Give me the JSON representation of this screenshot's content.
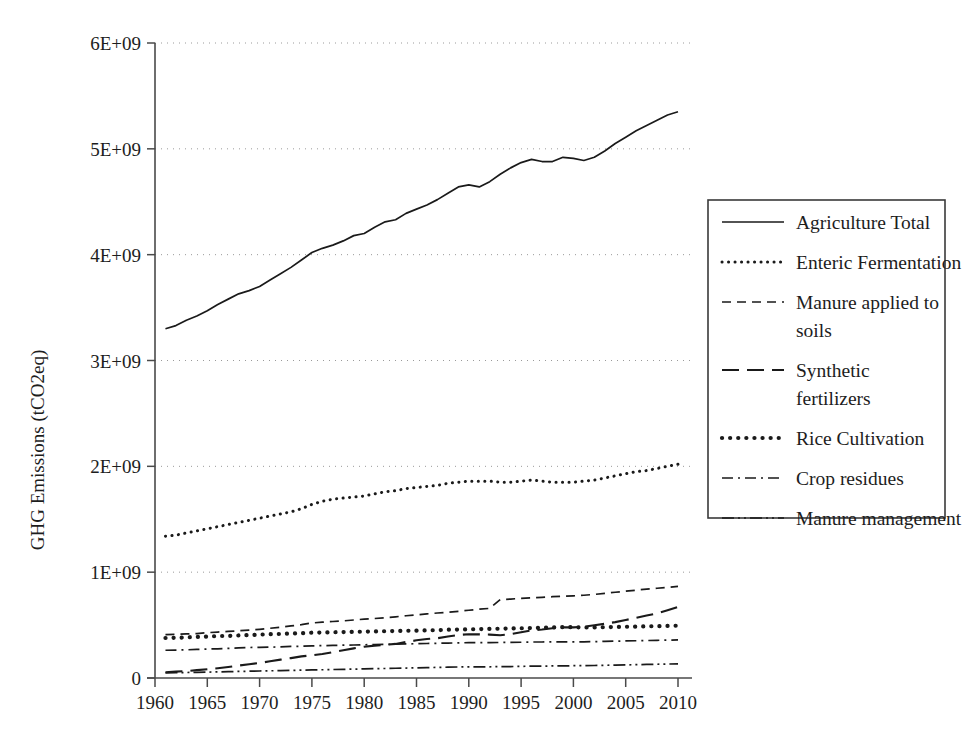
{
  "chart_data": {
    "type": "line",
    "title": "",
    "xlabel": "",
    "ylabel": "GHG Emissions (tCO2eq)",
    "xlim": [
      1960,
      2010
    ],
    "ylim": [
      0,
      6000000000
    ],
    "xticks": [
      "1960",
      "1965",
      "1970",
      "1975",
      "1980",
      "1985",
      "1990",
      "1995",
      "2000",
      "2005",
      "2010"
    ],
    "xtick_values": [
      1960,
      1965,
      1970,
      1975,
      1980,
      1985,
      1990,
      1995,
      2000,
      2005,
      2010
    ],
    "yticks": [
      "0",
      "1E+09",
      "2E+09",
      "3E+09",
      "4E+09",
      "5E+09",
      "6E+09"
    ],
    "ytick_values": [
      0,
      1000000000,
      2000000000,
      3000000000,
      4000000000,
      5000000000,
      6000000000
    ],
    "grid": "horizontal-dotted",
    "legend_position": "right",
    "x": [
      1961,
      1962,
      1963,
      1964,
      1965,
      1966,
      1967,
      1968,
      1969,
      1970,
      1971,
      1972,
      1973,
      1974,
      1975,
      1976,
      1977,
      1978,
      1979,
      1980,
      1981,
      1982,
      1983,
      1984,
      1985,
      1986,
      1987,
      1988,
      1989,
      1990,
      1991,
      1992,
      1993,
      1994,
      1995,
      1996,
      1997,
      1998,
      1999,
      2000,
      2001,
      2002,
      2003,
      2004,
      2005,
      2006,
      2007,
      2008,
      2009,
      2010
    ],
    "series": [
      {
        "name": "Agriculture Total",
        "style": "solid",
        "values": [
          3300000000,
          3330000000,
          3380000000,
          3420000000,
          3470000000,
          3530000000,
          3580000000,
          3630000000,
          3660000000,
          3700000000,
          3760000000,
          3820000000,
          3880000000,
          3950000000,
          4020000000,
          4060000000,
          4090000000,
          4130000000,
          4180000000,
          4200000000,
          4260000000,
          4310000000,
          4330000000,
          4390000000,
          4430000000,
          4470000000,
          4520000000,
          4580000000,
          4640000000,
          4660000000,
          4640000000,
          4690000000,
          4760000000,
          4820000000,
          4870000000,
          4900000000,
          4880000000,
          4880000000,
          4920000000,
          4910000000,
          4890000000,
          4920000000,
          4980000000,
          5050000000,
          5110000000,
          5170000000,
          5220000000,
          5270000000,
          5320000000,
          5350000000
        ]
      },
      {
        "name": "Enteric Fermentation",
        "style": "dotted",
        "values": [
          1340000000,
          1350000000,
          1370000000,
          1390000000,
          1410000000,
          1430000000,
          1450000000,
          1470000000,
          1490000000,
          1510000000,
          1530000000,
          1550000000,
          1570000000,
          1600000000,
          1640000000,
          1670000000,
          1690000000,
          1700000000,
          1710000000,
          1720000000,
          1740000000,
          1760000000,
          1770000000,
          1790000000,
          1800000000,
          1810000000,
          1820000000,
          1840000000,
          1850000000,
          1860000000,
          1860000000,
          1860000000,
          1850000000,
          1850000000,
          1860000000,
          1870000000,
          1860000000,
          1850000000,
          1850000000,
          1850000000,
          1860000000,
          1870000000,
          1890000000,
          1910000000,
          1930000000,
          1950000000,
          1960000000,
          1980000000,
          2000000000,
          2020000000
        ]
      },
      {
        "name": "Manure applied to soils",
        "style": "dashed",
        "values": [
          410000000,
          412000000,
          416000000,
          420000000,
          428000000,
          434000000,
          440000000,
          446000000,
          452000000,
          460000000,
          470000000,
          480000000,
          492000000,
          504000000,
          520000000,
          528000000,
          534000000,
          540000000,
          548000000,
          556000000,
          562000000,
          570000000,
          578000000,
          588000000,
          596000000,
          606000000,
          614000000,
          622000000,
          630000000,
          640000000,
          650000000,
          658000000,
          740000000,
          746000000,
          752000000,
          758000000,
          762000000,
          768000000,
          772000000,
          776000000,
          782000000,
          790000000,
          800000000,
          810000000,
          820000000,
          830000000,
          840000000,
          848000000,
          856000000,
          866000000
        ]
      },
      {
        "name": "Synthetic fertilizers",
        "style": "longdash",
        "values": [
          55000000,
          60000000,
          66000000,
          74000000,
          82000000,
          92000000,
          104000000,
          118000000,
          130000000,
          142000000,
          158000000,
          174000000,
          188000000,
          204000000,
          214000000,
          226000000,
          244000000,
          262000000,
          280000000,
          296000000,
          306000000,
          314000000,
          322000000,
          340000000,
          356000000,
          368000000,
          376000000,
          392000000,
          406000000,
          414000000,
          412000000,
          410000000,
          404000000,
          414000000,
          432000000,
          450000000,
          458000000,
          470000000,
          478000000,
          478000000,
          484000000,
          498000000,
          512000000,
          528000000,
          548000000,
          568000000,
          590000000,
          610000000,
          640000000,
          672000000
        ]
      },
      {
        "name": "Rice Cultivation",
        "style": "thick-dotted",
        "values": [
          378000000,
          380000000,
          384000000,
          388000000,
          392000000,
          396000000,
          398000000,
          402000000,
          406000000,
          410000000,
          414000000,
          416000000,
          420000000,
          424000000,
          428000000,
          430000000,
          432000000,
          434000000,
          436000000,
          438000000,
          440000000,
          442000000,
          444000000,
          446000000,
          448000000,
          450000000,
          452000000,
          456000000,
          458000000,
          460000000,
          462000000,
          464000000,
          466000000,
          468000000,
          470000000,
          472000000,
          476000000,
          478000000,
          480000000,
          480000000,
          478000000,
          478000000,
          480000000,
          482000000,
          484000000,
          486000000,
          488000000,
          490000000,
          492000000,
          494000000
        ]
      },
      {
        "name": "Crop residues",
        "style": "dashdot",
        "values": [
          262000000,
          264000000,
          266000000,
          270000000,
          274000000,
          276000000,
          280000000,
          284000000,
          288000000,
          290000000,
          292000000,
          294000000,
          298000000,
          300000000,
          304000000,
          306000000,
          308000000,
          310000000,
          312000000,
          314000000,
          316000000,
          318000000,
          320000000,
          322000000,
          324000000,
          326000000,
          328000000,
          330000000,
          332000000,
          334000000,
          334000000,
          334000000,
          336000000,
          336000000,
          338000000,
          340000000,
          340000000,
          342000000,
          342000000,
          342000000,
          342000000,
          344000000,
          346000000,
          348000000,
          350000000,
          352000000,
          354000000,
          356000000,
          358000000,
          360000000
        ]
      },
      {
        "name": "Manure management",
        "style": "dashdotdot",
        "values": [
          48000000,
          50000000,
          52000000,
          54000000,
          56000000,
          58000000,
          60000000,
          62000000,
          64000000,
          66000000,
          68000000,
          70000000,
          72000000,
          74000000,
          76000000,
          78000000,
          80000000,
          82000000,
          84000000,
          86000000,
          88000000,
          90000000,
          92000000,
          94000000,
          96000000,
          98000000,
          100000000,
          102000000,
          104000000,
          106000000,
          106000000,
          106000000,
          108000000,
          108000000,
          110000000,
          112000000,
          112000000,
          114000000,
          114000000,
          116000000,
          116000000,
          118000000,
          120000000,
          122000000,
          124000000,
          126000000,
          128000000,
          130000000,
          132000000,
          134000000
        ]
      }
    ]
  },
  "legend": {
    "items": [
      {
        "label": "Agriculture Total",
        "style": "solid"
      },
      {
        "label": "Enteric Fermentation",
        "style": "dotted"
      },
      {
        "label": "Manure applied to soils",
        "style": "dashed"
      },
      {
        "label": "Synthetic fertilizers",
        "style": "longdash"
      },
      {
        "label": "Rice Cultivation",
        "style": "thick-dotted"
      },
      {
        "label": "Crop residues",
        "style": "dashdot"
      },
      {
        "label": "Manure management",
        "style": "dashdotdot"
      }
    ]
  }
}
